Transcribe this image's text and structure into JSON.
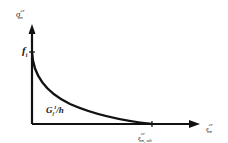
{
  "diagram": {
    "title": "",
    "y_axis": {
      "symbol": "σ",
      "superscript": "cr",
      "subscript": "nn"
    },
    "x_axis": {
      "symbol": "ε",
      "superscript": "cr",
      "subscript": "nn"
    },
    "peak_label": {
      "symbol": "f",
      "subscript": "t"
    },
    "area_label": {
      "symbol": "G",
      "subscript": "f",
      "superscript": "I",
      "suffix": "/h"
    },
    "ultimate_strain_label": {
      "symbol": "ε",
      "superscript": "cr",
      "subscript": "nn, ult"
    },
    "curve": "softening curve from f_t decaying to zero at ε_nn,ult",
    "colors": {
      "line": "#111111",
      "background": "#ffffff"
    }
  }
}
